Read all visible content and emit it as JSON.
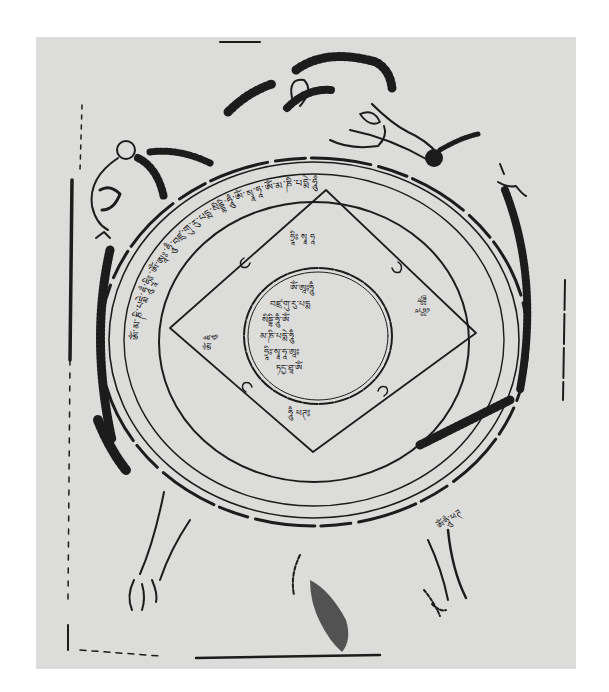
{
  "image": {
    "subject": "Woodblock print of a Tibetan protective diagram: a tortoise with a circular mandala on its shell",
    "width": 609,
    "height": 692,
    "colors": {
      "background": "#ffffff",
      "paper": "#dcdcdb",
      "ink": "#1c1c1c"
    }
  },
  "diagram": {
    "paper_rect": {
      "x": 36,
      "y": 37,
      "w": 540,
      "h": 632
    },
    "center_circle": {
      "cx": 318,
      "cy": 336,
      "rx": 74,
      "ry": 68
    },
    "diamond": {
      "top": [
        326,
        190
      ],
      "right": [
        476,
        333
      ],
      "bottom": [
        313,
        452
      ],
      "left": [
        170,
        328
      ]
    },
    "rings": [
      {
        "name": "inner-ring",
        "cx": 314,
        "cy": 340,
        "rx": 155,
        "ry": 140
      },
      {
        "name": "text-band-inner",
        "cx": 314,
        "cy": 340,
        "rx": 190,
        "ry": 168
      },
      {
        "name": "text-band-outer",
        "cx": 314,
        "cy": 340,
        "rx": 205,
        "ry": 178
      },
      {
        "name": "shell-edge",
        "cx": 314,
        "cy": 342,
        "rx": 214,
        "ry": 184
      }
    ],
    "inscriptions": {
      "diamond_top": "ཧྲཱིཿ སྭཱ ཧཱ",
      "diamond_left": "ཨོཾ ཧཱུྃ",
      "diamond_right": "ཨཱཿ ཧྲཱིཿ",
      "diamond_bottom": "ཧཱུྃ ཕཊ༔",
      "center_lines": [
        "ཨོཾ་ཨཱཿཧཱུྃ",
        "བཛྲ་གུ་རུ་པདྨ",
        "སིདྡྷི་ཧཱུྃ་ཨོཾ",
        "མ་ཎི་པདྨེ་ཧཱུྃ",
        "ཧྲཱིཿ་སྭཱ་ཧཱ་ཨཱཿ",
        "ཏདྱ་ཐཱ་ཨོཾ"
      ],
      "ring_band": "ཨོཾ་མ་ཎི་པདྨེ་ཧཱུྃ་ཧྲཱིཿ་ཨོཾ་ཨཱཿ་ཧཱུྃ་བཛྲ་གུ་རུ་པདྨ་སིདྡྷི་ཧཱུྃ་ཨོཾ་སྭཱ་ཧཱ་ཨོཾ་མ་ཎི་པདྨེ་ཧཱུྃ",
      "tail_right": "ཨོཾ་ཧཱུྃ་ཕཊ"
    },
    "figures": [
      "tortoise-head",
      "tortoise-front-left-limb",
      "tortoise-front-right-limb",
      "tortoise-back-left-leg",
      "tortoise-tail-leg",
      "tortoise-back-right-leg"
    ]
  }
}
